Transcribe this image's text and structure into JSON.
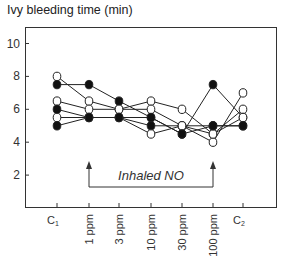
{
  "chart_data": {
    "type": "line",
    "title": "Ivy bleeding time (min)",
    "xlabel": "",
    "ylabel": "Ivy bleeding time (min)",
    "categories": [
      "C1",
      "1 ppm",
      "3 ppm",
      "10 ppm",
      "30 ppm",
      "100 ppm",
      "C2"
    ],
    "yticks": [
      2,
      4,
      6,
      8,
      10
    ],
    "ylim": [
      0,
      11
    ],
    "grid": false,
    "legend": null,
    "annotation": {
      "text": "Inhaled NO",
      "from_category": "1 ppm",
      "to_category": "100 ppm"
    },
    "series": [
      {
        "name": "Subject 1",
        "marker": "open",
        "values": [
          8.0,
          6.5,
          6.0,
          6.5,
          6.0,
          4.5,
          6.0
        ]
      },
      {
        "name": "Subject 2",
        "marker": "filled",
        "values": [
          7.5,
          7.5,
          6.5,
          5.5,
          4.5,
          7.5,
          5.5
        ]
      },
      {
        "name": "Subject 3",
        "marker": "open",
        "values": [
          6.5,
          6.0,
          6.0,
          6.0,
          5.0,
          4.0,
          7.0
        ]
      },
      {
        "name": "Subject 4",
        "marker": "filled",
        "values": [
          6.0,
          5.5,
          5.5,
          5.0,
          5.0,
          5.0,
          5.0
        ]
      },
      {
        "name": "Subject 5",
        "marker": "open",
        "values": [
          5.5,
          5.5,
          5.5,
          4.5,
          5.0,
          4.5,
          5.5
        ]
      },
      {
        "name": "Subject 6",
        "marker": "filled",
        "values": [
          5.0,
          5.5,
          5.5,
          5.5,
          4.5,
          5.0,
          5.0
        ]
      }
    ]
  },
  "colors": {
    "axis": "#333333",
    "line": "#222222",
    "marker_fill": "#111111",
    "marker_open": "#ffffff"
  }
}
